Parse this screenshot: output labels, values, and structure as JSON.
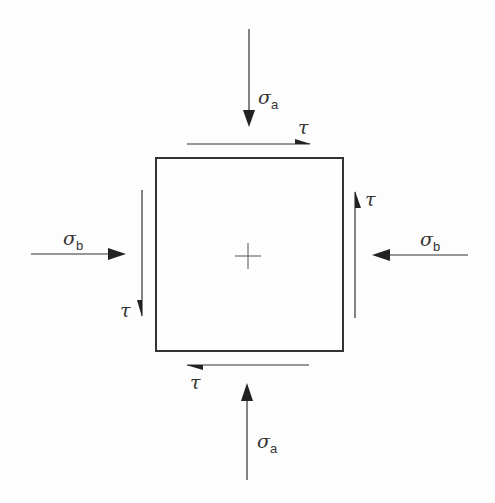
{
  "diagram": {
    "element": {
      "x": 156,
      "y": 158,
      "width": 187,
      "height": 193,
      "stroke": "#333333"
    },
    "center_mark": {
      "x": 248,
      "y": 256,
      "arm": 13
    },
    "normal_stresses": [
      {
        "id": "sigma-a-top",
        "symbol": "σ",
        "subscript": "a",
        "direction": "down",
        "x1": 249,
        "y1": 29,
        "x2": 249,
        "y2": 126,
        "label_x": 258,
        "label_y": 104
      },
      {
        "id": "sigma-a-bottom",
        "symbol": "σ",
        "subscript": "a",
        "direction": "up",
        "x1": 247,
        "y1": 480,
        "x2": 247,
        "y2": 383,
        "label_x": 257,
        "label_y": 448
      },
      {
        "id": "sigma-b-left",
        "symbol": "σ",
        "subscript": "b",
        "direction": "right",
        "x1": 31,
        "y1": 254,
        "x2": 125,
        "y2": 254,
        "label_x": 63,
        "label_y": 245
      },
      {
        "id": "sigma-b-right",
        "symbol": "σ",
        "subscript": "b",
        "direction": "left",
        "x1": 468,
        "y1": 255,
        "x2": 372,
        "y2": 255,
        "label_x": 420,
        "label_y": 246
      }
    ],
    "shear_stresses": [
      {
        "id": "tau-top",
        "symbol": "τ",
        "direction": "right",
        "x1": 187,
        "y1": 144,
        "x2": 310,
        "y2": 144,
        "label_x": 298,
        "label_y": 134
      },
      {
        "id": "tau-bottom",
        "symbol": "τ",
        "direction": "left",
        "x1": 309,
        "y1": 365,
        "x2": 187,
        "y2": 365,
        "label_x": 190,
        "label_y": 389
      },
      {
        "id": "tau-left",
        "symbol": "τ",
        "direction": "down",
        "x1": 142,
        "y1": 190,
        "x2": 142,
        "y2": 316,
        "label_x": 120,
        "label_y": 317
      },
      {
        "id": "tau-right",
        "symbol": "τ",
        "direction": "up",
        "x1": 355,
        "y1": 318,
        "x2": 355,
        "y2": 192,
        "label_x": 365,
        "label_y": 206
      }
    ]
  },
  "labels": {
    "sigma": "σ",
    "tau": "τ",
    "sub_a": "a",
    "sub_b": "b"
  }
}
